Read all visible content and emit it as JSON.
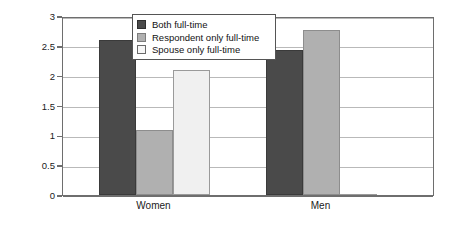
{
  "chart_data": {
    "type": "bar",
    "title": "",
    "xlabel": "",
    "ylabel": "Perceptions of unfairness",
    "categories": [
      "Women",
      "Men"
    ],
    "series": [
      {
        "name": "Both full-time",
        "values": [
          2.59,
          2.43
        ],
        "color": "#4a4a4a"
      },
      {
        "name": "Respondent only full-time",
        "values": [
          1.09,
          2.77
        ],
        "color": "#b0b0b0"
      },
      {
        "name": "Spouse only full-time",
        "values": [
          2.1,
          0.01
        ],
        "color": "#f0f0f0"
      }
    ],
    "ylim": [
      0,
      3
    ],
    "yticks": [
      "0",
      "0.5",
      "1",
      "1.5",
      "2",
      "2.5",
      "3"
    ],
    "ytick_values": [
      0,
      0.5,
      1,
      1.5,
      2,
      2.5,
      3
    ],
    "grid": true,
    "legend_position": "top-center"
  }
}
